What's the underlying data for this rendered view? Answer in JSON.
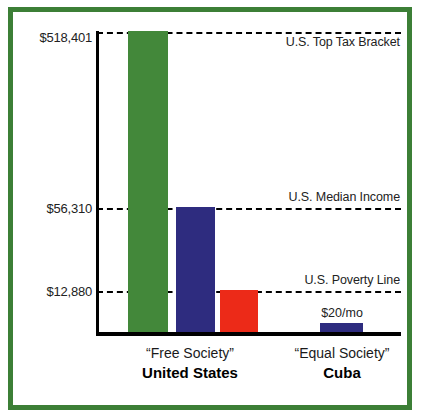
{
  "chart_data": {
    "type": "bar",
    "title": "",
    "subtitle": "",
    "xlabel": "",
    "ylabel": "",
    "ylim": [
      0,
      518401
    ],
    "grid": false,
    "legend_position": "none",
    "scale_note": "non-linear / illustrative vertical scale",
    "categories": [
      "“Free Society” United States",
      "“Equal Society” Cuba"
    ],
    "bars": [
      {
        "name": "U.S. Top Tax Bracket",
        "group": "United States",
        "value": 518401,
        "value_label": "$518,401",
        "color": "#43883a"
      },
      {
        "name": "U.S. Median Income",
        "group": "United States",
        "value": 56310,
        "value_label": "$56,310",
        "color": "#2e2c7f"
      },
      {
        "name": "U.S. Poverty Line",
        "group": "United States",
        "value": 12880,
        "value_label": "$12,880",
        "color": "#ec2a18"
      },
      {
        "name": "Cuba Average Wage",
        "group": "Cuba",
        "value": 240,
        "value_label": "$20/mo",
        "color": "#2e2c7f"
      }
    ],
    "reference_lines": [
      {
        "label": "U.S. Top Tax Bracket",
        "value": 518401,
        "tick": "$518,401",
        "style": "dashed"
      },
      {
        "label": "U.S. Median Income",
        "value": 56310,
        "tick": "$56,310",
        "style": "dashed"
      },
      {
        "label": "U.S. Poverty Line",
        "value": 12880,
        "tick": "$12,880",
        "style": "dashed"
      }
    ],
    "tick_labels": [
      "$518,401",
      "$56,310",
      "$12,880"
    ],
    "annotations": [
      "U.S. Top Tax Bracket",
      "U.S. Median Income",
      "U.S. Poverty Line",
      "$20/mo"
    ]
  },
  "axis": {
    "ticks": {
      "top": "$518,401",
      "median": "$56,310",
      "poverty": "$12,880"
    }
  },
  "annotations": {
    "top": "U.S. Top Tax Bracket",
    "median": "U.S. Median Income",
    "poverty": "U.S. Poverty Line",
    "cuba_bar": "$20/mo"
  },
  "groups": {
    "us": {
      "quoted": "“Free Society”",
      "country": "United States"
    },
    "cuba": {
      "quoted": "“Equal Society”",
      "country": "Cuba"
    }
  },
  "colors": {
    "frame": "#3c7f36",
    "bar_green": "#43883a",
    "bar_navy": "#2e2c7f",
    "bar_red": "#ec2a18",
    "axis": "#000000",
    "background": "#ffffff"
  }
}
